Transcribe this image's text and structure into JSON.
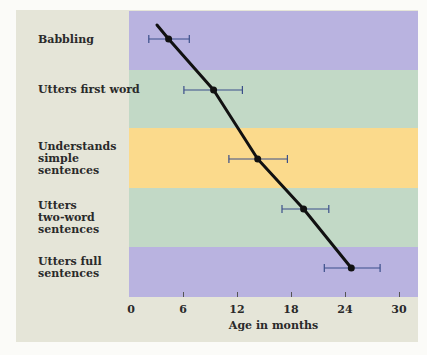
{
  "chart_data": {
    "type": "scatter",
    "title": "",
    "xlabel": "Age in months",
    "ylabel": "",
    "xlim": [
      0,
      32
    ],
    "xticks": [
      0,
      6,
      12,
      18,
      24,
      30
    ],
    "grid": false,
    "legend": "none",
    "categories": [
      "Babbling",
      "Utters first word",
      "Understands simple sentences",
      "Utters two-word sentences",
      "Utters full sentences"
    ],
    "series": [
      {
        "name": "Average age of milestone",
        "values": [
          4.4,
          9.4,
          14.3,
          19.4,
          24.7
        ],
        "error_low": [
          2.2,
          6.1,
          11.1,
          17.0,
          21.7
        ],
        "error_high": [
          6.7,
          12.6,
          17.6,
          22.2,
          27.9
        ]
      }
    ],
    "band_colors": [
      "#b9b3e0",
      "#c2d9c6",
      "#fbda8c",
      "#c2d9c6",
      "#b9b3e0"
    ]
  },
  "labels": [
    {
      "text": "Babbling"
    },
    {
      "text": "Utters first word"
    },
    {
      "text": "Understands\nsimple\nsentences"
    },
    {
      "text": "Utters\ntwo-word\nsentences"
    },
    {
      "text": "Utters full\nsentences"
    }
  ],
  "ticks": [
    "0",
    "6",
    "12",
    "18",
    "24",
    "30"
  ],
  "colors": {
    "panel": "#e5e5d8",
    "line": "#111111",
    "errorbar": "#3b4f8a"
  }
}
